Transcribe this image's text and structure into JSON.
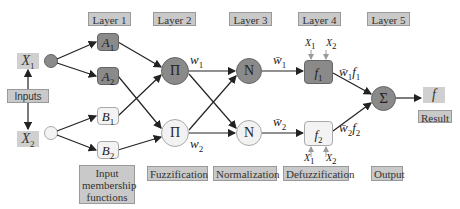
{
  "layers": {
    "l1": "Layer 1",
    "l2": "Layer 2",
    "l3": "Layer 3",
    "l4": "Layer 4",
    "l5": "Layer 5"
  },
  "stages": {
    "input_mf": "Input membership functions",
    "fuzzification": "Fuzzification",
    "normalization": "Normalization",
    "defuzzification": "Defuzzification",
    "output": "Output"
  },
  "inputs": {
    "label": "Inputs",
    "x1": "X",
    "x1_sub": "1",
    "x2": "X",
    "x2_sub": "2"
  },
  "layer1_nodes": [
    {
      "name": "A",
      "sub": "1"
    },
    {
      "name": "A",
      "sub": "2"
    },
    {
      "name": "B",
      "sub": "1"
    },
    {
      "name": "B",
      "sub": "2"
    }
  ],
  "layer2_nodes": [
    {
      "symbol": "Π",
      "weight": "w",
      "weight_sub": "1"
    },
    {
      "symbol": "Π",
      "weight": "w",
      "weight_sub": "2"
    }
  ],
  "layer3_nodes": [
    {
      "symbol": "N",
      "output": "w̄",
      "output_sub": "1"
    },
    {
      "symbol": "N",
      "output": "w̄",
      "output_sub": "2"
    }
  ],
  "layer4_nodes": [
    {
      "name": "f",
      "sub": "1",
      "in1": "X",
      "in1_sub": "1",
      "in2": "X",
      "in2_sub": "2",
      "output": "w̄",
      "output_sub": "1",
      "output_f": "f",
      "output_f_sub": "1"
    },
    {
      "name": "f",
      "sub": "2",
      "in1": "X",
      "in1_sub": "1",
      "in2": "X",
      "in2_sub": "2",
      "output": "w̄",
      "output_sub": "2",
      "output_f": "f",
      "output_f_sub": "2"
    }
  ],
  "layer5_node": {
    "symbol": "Σ"
  },
  "result": {
    "value": "f",
    "label": "Result"
  },
  "colors": {
    "label_bg": "#c9c9c9",
    "dark_node": "#8a8a8a",
    "light_node": "#f2f2f2",
    "edge": "#222222",
    "feed_arrow": "#9a9a9a"
  }
}
